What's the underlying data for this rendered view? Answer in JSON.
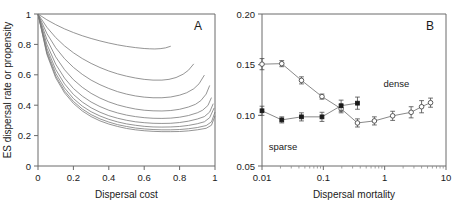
{
  "figure": {
    "width": 460,
    "height": 224,
    "background": "#ffffff",
    "line_color": "#7a7a7a",
    "axis_color": "#6b6b6b",
    "text_color": "#1a1a1a"
  },
  "chart_data": [
    {
      "type": "line",
      "panel": "A",
      "panel_label": "A",
      "title": "",
      "xlabel": "Dispersal cost",
      "ylabel": "ES dispersal rate or propensity",
      "xlim": [
        0,
        1
      ],
      "ylim": [
        0,
        1
      ],
      "xticks": [
        0,
        0.2,
        0.4,
        0.6,
        0.8,
        1
      ],
      "xticklabels": [
        "0",
        "0.2",
        "0.4",
        "0.6",
        "0.8",
        "1"
      ],
      "yticks": [
        0,
        0.2,
        0.4,
        0.6,
        0.8,
        1
      ],
      "yticklabels": [
        "0",
        "0.2",
        "0.4",
        "0.6",
        "0.8",
        "1"
      ],
      "grid": false,
      "legend": "none",
      "series": [
        {
          "name": "curve-1",
          "x": [
            0.0,
            0.05,
            0.1,
            0.15,
            0.2,
            0.25,
            0.3,
            0.35,
            0.4,
            0.45,
            0.5,
            0.55,
            0.6,
            0.63,
            0.66,
            0.69,
            0.72,
            0.75
          ],
          "values": [
            1.0,
            0.962,
            0.93,
            0.902,
            0.878,
            0.857,
            0.839,
            0.823,
            0.809,
            0.797,
            0.787,
            0.779,
            0.773,
            0.771,
            0.77,
            0.772,
            0.777,
            0.788
          ]
        },
        {
          "name": "curve-2",
          "x": [
            0.0,
            0.05,
            0.1,
            0.15,
            0.2,
            0.25,
            0.3,
            0.35,
            0.4,
            0.45,
            0.5,
            0.55,
            0.6,
            0.65,
            0.7,
            0.74,
            0.78,
            0.82,
            0.85,
            0.88
          ],
          "values": [
            1.0,
            0.913,
            0.845,
            0.79,
            0.745,
            0.707,
            0.675,
            0.648,
            0.625,
            0.606,
            0.591,
            0.579,
            0.57,
            0.565,
            0.565,
            0.57,
            0.582,
            0.604,
            0.63,
            0.672
          ]
        },
        {
          "name": "curve-3",
          "x": [
            0.0,
            0.05,
            0.1,
            0.15,
            0.2,
            0.25,
            0.3,
            0.35,
            0.4,
            0.45,
            0.5,
            0.55,
            0.6,
            0.65,
            0.7,
            0.75,
            0.8,
            0.84,
            0.88,
            0.91,
            0.94
          ],
          "values": [
            1.0,
            0.872,
            0.778,
            0.706,
            0.649,
            0.603,
            0.565,
            0.535,
            0.51,
            0.489,
            0.473,
            0.461,
            0.453,
            0.449,
            0.449,
            0.454,
            0.466,
            0.482,
            0.508,
            0.541,
            0.598
          ]
        },
        {
          "name": "curve-4",
          "x": [
            0.0,
            0.05,
            0.1,
            0.15,
            0.2,
            0.25,
            0.3,
            0.35,
            0.4,
            0.45,
            0.5,
            0.55,
            0.6,
            0.65,
            0.7,
            0.75,
            0.8,
            0.85,
            0.89,
            0.92,
            0.95,
            0.97
          ],
          "values": [
            1.0,
            0.834,
            0.718,
            0.633,
            0.568,
            0.518,
            0.478,
            0.447,
            0.422,
            0.402,
            0.387,
            0.375,
            0.367,
            0.363,
            0.362,
            0.365,
            0.373,
            0.388,
            0.406,
            0.43,
            0.473,
            0.53
          ]
        },
        {
          "name": "curve-5",
          "x": [
            0.0,
            0.05,
            0.1,
            0.15,
            0.2,
            0.25,
            0.3,
            0.35,
            0.4,
            0.45,
            0.5,
            0.55,
            0.6,
            0.65,
            0.7,
            0.75,
            0.8,
            0.85,
            0.9,
            0.93,
            0.96,
            0.98
          ],
          "values": [
            1.0,
            0.801,
            0.67,
            0.578,
            0.51,
            0.46,
            0.421,
            0.391,
            0.367,
            0.349,
            0.335,
            0.325,
            0.318,
            0.314,
            0.313,
            0.315,
            0.321,
            0.332,
            0.35,
            0.367,
            0.398,
            0.45
          ]
        },
        {
          "name": "curve-6",
          "x": [
            0.0,
            0.05,
            0.1,
            0.15,
            0.2,
            0.25,
            0.3,
            0.35,
            0.4,
            0.45,
            0.5,
            0.55,
            0.6,
            0.65,
            0.7,
            0.75,
            0.8,
            0.85,
            0.9,
            0.94,
            0.97,
            0.99
          ],
          "values": [
            1.0,
            0.775,
            0.635,
            0.54,
            0.471,
            0.421,
            0.383,
            0.354,
            0.331,
            0.314,
            0.301,
            0.291,
            0.285,
            0.281,
            0.28,
            0.281,
            0.286,
            0.295,
            0.309,
            0.325,
            0.355,
            0.41
          ]
        },
        {
          "name": "curve-7",
          "x": [
            0.0,
            0.05,
            0.1,
            0.15,
            0.2,
            0.25,
            0.3,
            0.35,
            0.4,
            0.45,
            0.5,
            0.55,
            0.6,
            0.65,
            0.7,
            0.75,
            0.8,
            0.85,
            0.9,
            0.94,
            0.97,
            0.995
          ],
          "values": [
            1.0,
            0.757,
            0.61,
            0.513,
            0.444,
            0.394,
            0.357,
            0.329,
            0.307,
            0.29,
            0.277,
            0.268,
            0.261,
            0.257,
            0.256,
            0.257,
            0.26,
            0.267,
            0.278,
            0.291,
            0.318,
            0.382
          ]
        },
        {
          "name": "curve-8",
          "x": [
            0.0,
            0.05,
            0.1,
            0.15,
            0.2,
            0.25,
            0.3,
            0.35,
            0.4,
            0.45,
            0.5,
            0.55,
            0.6,
            0.65,
            0.7,
            0.75,
            0.8,
            0.85,
            0.9,
            0.95,
            0.98,
            1.0
          ],
          "values": [
            1.0,
            0.744,
            0.592,
            0.494,
            0.425,
            0.375,
            0.338,
            0.31,
            0.289,
            0.272,
            0.26,
            0.25,
            0.244,
            0.24,
            0.238,
            0.238,
            0.24,
            0.245,
            0.253,
            0.266,
            0.29,
            0.355
          ]
        },
        {
          "name": "curve-9",
          "x": [
            0.0,
            0.05,
            0.1,
            0.15,
            0.2,
            0.25,
            0.3,
            0.35,
            0.4,
            0.45,
            0.5,
            0.55,
            0.6,
            0.65,
            0.7,
            0.75,
            0.8,
            0.85,
            0.9,
            0.95,
            0.98,
            1.0
          ],
          "values": [
            1.0,
            0.735,
            0.58,
            0.481,
            0.412,
            0.362,
            0.325,
            0.297,
            0.276,
            0.26,
            0.247,
            0.238,
            0.232,
            0.228,
            0.226,
            0.226,
            0.227,
            0.231,
            0.238,
            0.248,
            0.268,
            0.33
          ]
        }
      ]
    },
    {
      "type": "scatter",
      "panel": "B",
      "panel_label": "B",
      "title": "",
      "xlabel": "Dispersal mortality",
      "ylabel": "",
      "xscale": "log",
      "xlim": [
        0.01,
        10
      ],
      "ylim": [
        0.05,
        0.2
      ],
      "xticks": [
        0.01,
        0.1,
        1,
        10
      ],
      "xticklabels": [
        "0.01",
        "0.1",
        "1",
        "10"
      ],
      "yticks": [
        0.05,
        0.1,
        0.15,
        0.2
      ],
      "yticklabels": [
        "0.05",
        "0.10",
        "0.15",
        "0.20"
      ],
      "grid": false,
      "legend": "inline-annotations",
      "annotations": [
        {
          "text": "dense",
          "x": 1.55,
          "y": 0.128
        },
        {
          "text": "sparse",
          "x": 0.022,
          "y": 0.066
        }
      ],
      "series": [
        {
          "name": "dense",
          "marker": "open-circle",
          "label": "dense",
          "x": [
            0.01,
            0.021,
            0.044,
            0.095,
            0.195,
            0.36,
            0.68,
            1.35,
            2.7,
            4.0,
            5.6
          ],
          "values": [
            0.1505,
            0.151,
            0.1345,
            0.1185,
            0.1065,
            0.0925,
            0.0945,
            0.0995,
            0.103,
            0.1085,
            0.1125
          ],
          "errors": [
            0.0055,
            0.003,
            0.0035,
            0.0025,
            0.004,
            0.004,
            0.004,
            0.0045,
            0.0055,
            0.006,
            0.0045
          ]
        },
        {
          "name": "sparse",
          "marker": "filled-square",
          "label": "sparse",
          "x": [
            0.01,
            0.021,
            0.044,
            0.095,
            0.195,
            0.36
          ],
          "values": [
            0.1045,
            0.0955,
            0.0985,
            0.0985,
            0.1095,
            0.112
          ],
          "errors": [
            0.0045,
            0.003,
            0.004,
            0.0045,
            0.0055,
            0.006
          ]
        }
      ]
    }
  ]
}
